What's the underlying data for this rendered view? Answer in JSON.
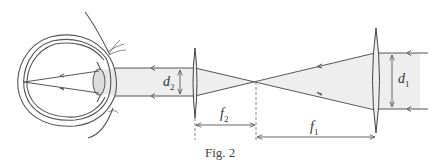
{
  "figure": {
    "caption": "Fig. 2",
    "labels": {
      "d2": {
        "symbol": "d",
        "sub": "2"
      },
      "d1": {
        "symbol": "d",
        "sub": "1"
      },
      "f2": {
        "symbol": "f",
        "sub": "2"
      },
      "f1": {
        "symbol": "f",
        "sub": "1"
      }
    },
    "elements": [
      "eye",
      "eyepiece-lens",
      "objective-lens",
      "light-beam",
      "focal-point"
    ],
    "colors": {
      "line": "#555555",
      "beam": "#eeeeee"
    }
  }
}
